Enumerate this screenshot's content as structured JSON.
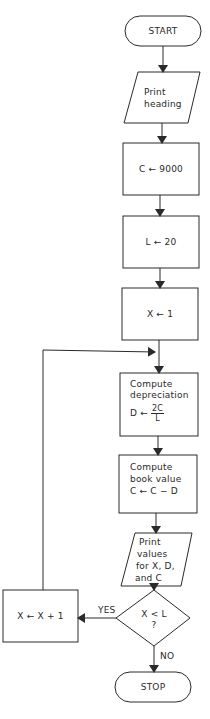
{
  "flowchart": {
    "start": {
      "label": "START"
    },
    "print_heading": {
      "line1": "Print",
      "line2": "heading"
    },
    "init_c": {
      "label": "C ← 9000"
    },
    "init_l": {
      "label": "L ← 20"
    },
    "init_x": {
      "label": "X ← 1"
    },
    "compute_depreciation": {
      "line1": "Compute",
      "line2": "depreciation",
      "lhs": "D ←",
      "numerator": "2C",
      "denominator": "L"
    },
    "compute_book_value": {
      "line1": "Compute",
      "line2": "book value",
      "line3": "C ← C − D"
    },
    "print_values": {
      "line1": "Print",
      "line2": "values",
      "line3": "for X, D,",
      "line4": "and C"
    },
    "decision": {
      "line1": "X < L",
      "line2": "?"
    },
    "increment_x": {
      "label": "X ← X + 1"
    },
    "yes_label": "YES",
    "no_label": "NO",
    "stop": {
      "label": "STOP"
    }
  }
}
